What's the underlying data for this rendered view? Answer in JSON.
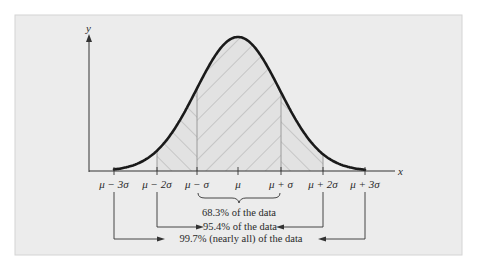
{
  "figure": {
    "type": "normal-distribution-diagram",
    "axes": {
      "x_label": "x",
      "y_label": "y"
    },
    "colors": {
      "frame_bg": "#ececec",
      "frame_border": "#d4d4d4",
      "curve": "#1a1a1a",
      "hatch": "#9a9a9a",
      "axis": "#333333",
      "text": "#2a2a2a"
    },
    "ticks": [
      {
        "label": "μ − 3σ",
        "pos": 114
      },
      {
        "label": "μ − 2σ",
        "pos": 157
      },
      {
        "label": "μ − σ",
        "pos": 197
      },
      {
        "label": "μ",
        "pos": 238
      },
      {
        "label": "μ + σ",
        "pos": 281
      },
      {
        "label": "μ + 2σ",
        "pos": 323
      },
      {
        "label": "μ + 3σ",
        "pos": 365
      }
    ],
    "annotations": [
      {
        "id": "one_sigma",
        "text": "68.3% of the data",
        "range": [
          "μ − σ",
          "μ + σ"
        ],
        "style": "brace"
      },
      {
        "id": "two_sigma",
        "text": "95.4% of the data",
        "range": [
          "μ − 2σ",
          "μ + 2σ"
        ],
        "style": "arrows"
      },
      {
        "id": "three_sigma",
        "text": "99.7% (nearly all) of the data",
        "range": [
          "μ − 3σ",
          "μ + 3σ"
        ],
        "style": "arrows"
      }
    ]
  },
  "chart_data": {
    "type": "area",
    "title": "",
    "xlabel": "x",
    "ylabel": "y",
    "categories": [
      "μ − 3σ",
      "μ − 2σ",
      "μ − σ",
      "μ",
      "μ + σ",
      "μ + 2σ",
      "μ + 3σ"
    ],
    "series": [
      {
        "name": "normal density (relative)",
        "values": [
          0.011,
          0.135,
          0.607,
          1.0,
          0.607,
          0.135,
          0.011
        ]
      }
    ],
    "shaded_regions": [
      {
        "from": "μ − σ",
        "to": "μ + σ",
        "hatch": "down-right",
        "percent": 68.3
      },
      {
        "from": "μ − 2σ",
        "to": "μ − σ",
        "hatch": "up-right"
      },
      {
        "from": "μ + σ",
        "to": "μ + 2σ",
        "hatch": "up-right"
      }
    ],
    "annotations": [
      "68.3% of the data",
      "95.4% of the data",
      "99.7% (nearly all) of the data"
    ],
    "grid": false
  }
}
